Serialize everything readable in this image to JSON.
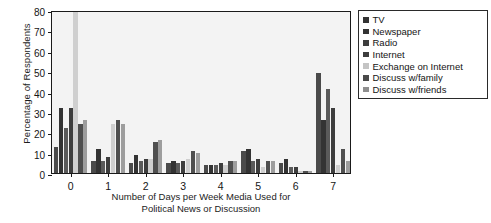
{
  "chart_data": {
    "type": "bar",
    "title": "",
    "xlabel": "Number of Days per Week Media Used for Political News or Discussion",
    "xlabel_line1": "Number of Days per Week Media Used for",
    "xlabel_line2": "Political News or Discussion",
    "ylabel": "Percentage of Respondents",
    "ylim": [
      0,
      80
    ],
    "yticks": [
      0,
      10,
      20,
      30,
      40,
      50,
      60,
      70,
      80
    ],
    "ytick_labels": [
      "0",
      "10",
      "20",
      "30",
      "40",
      "50",
      "60",
      "70",
      "80"
    ],
    "categories": [
      "0",
      "1",
      "2",
      "3",
      "4",
      "5",
      "6",
      "7"
    ],
    "xtick_labels": [
      "0",
      "1",
      "2",
      "3",
      "4",
      "5",
      "6",
      "7"
    ],
    "grid": false,
    "legend_position": "right",
    "series": [
      {
        "name": "TV",
        "color": "#4a4a4a",
        "values": [
          13,
          6,
          5,
          5,
          4,
          11,
          5,
          49
        ]
      },
      {
        "name": "Newspaper",
        "color": "#333333",
        "values": [
          32,
          12,
          9,
          6,
          4,
          12,
          7,
          26
        ]
      },
      {
        "name": "Radio",
        "color": "#5a5a5a",
        "values": [
          22,
          6,
          6,
          5,
          4,
          6,
          3,
          41
        ]
      },
      {
        "name": "Internet",
        "color": "#3d3d3d",
        "values": [
          32,
          8,
          7,
          6,
          5,
          7,
          3,
          32
        ]
      },
      {
        "name": "Exchange on Internet",
        "color": "#cfcfcf",
        "values": [
          79,
          24,
          7,
          7,
          4,
          3,
          1,
          4
        ]
      },
      {
        "name": "Discuss w/family",
        "color": "#4f4f4f",
        "values": [
          24,
          26,
          15,
          11,
          6,
          6,
          1,
          12
        ]
      },
      {
        "name": "Discuss w/friends",
        "color": "#9d9d9d",
        "values": [
          26,
          24,
          16,
          10,
          6,
          6,
          1,
          6
        ]
      }
    ]
  },
  "legend": {
    "items": [
      {
        "label": "TV",
        "color": "#333333"
      },
      {
        "label": "Newspaper",
        "color": "#333333"
      },
      {
        "label": "Radio",
        "color": "#3d3d3d"
      },
      {
        "label": "Internet",
        "color": "#3d3d3d"
      },
      {
        "label": "Exchange on Internet",
        "color": "#c4c4c4"
      },
      {
        "label": "Discuss w/family",
        "color": "#4a4a4a"
      },
      {
        "label": "Discuss w/friends",
        "color": "#8f8f8f"
      }
    ]
  }
}
